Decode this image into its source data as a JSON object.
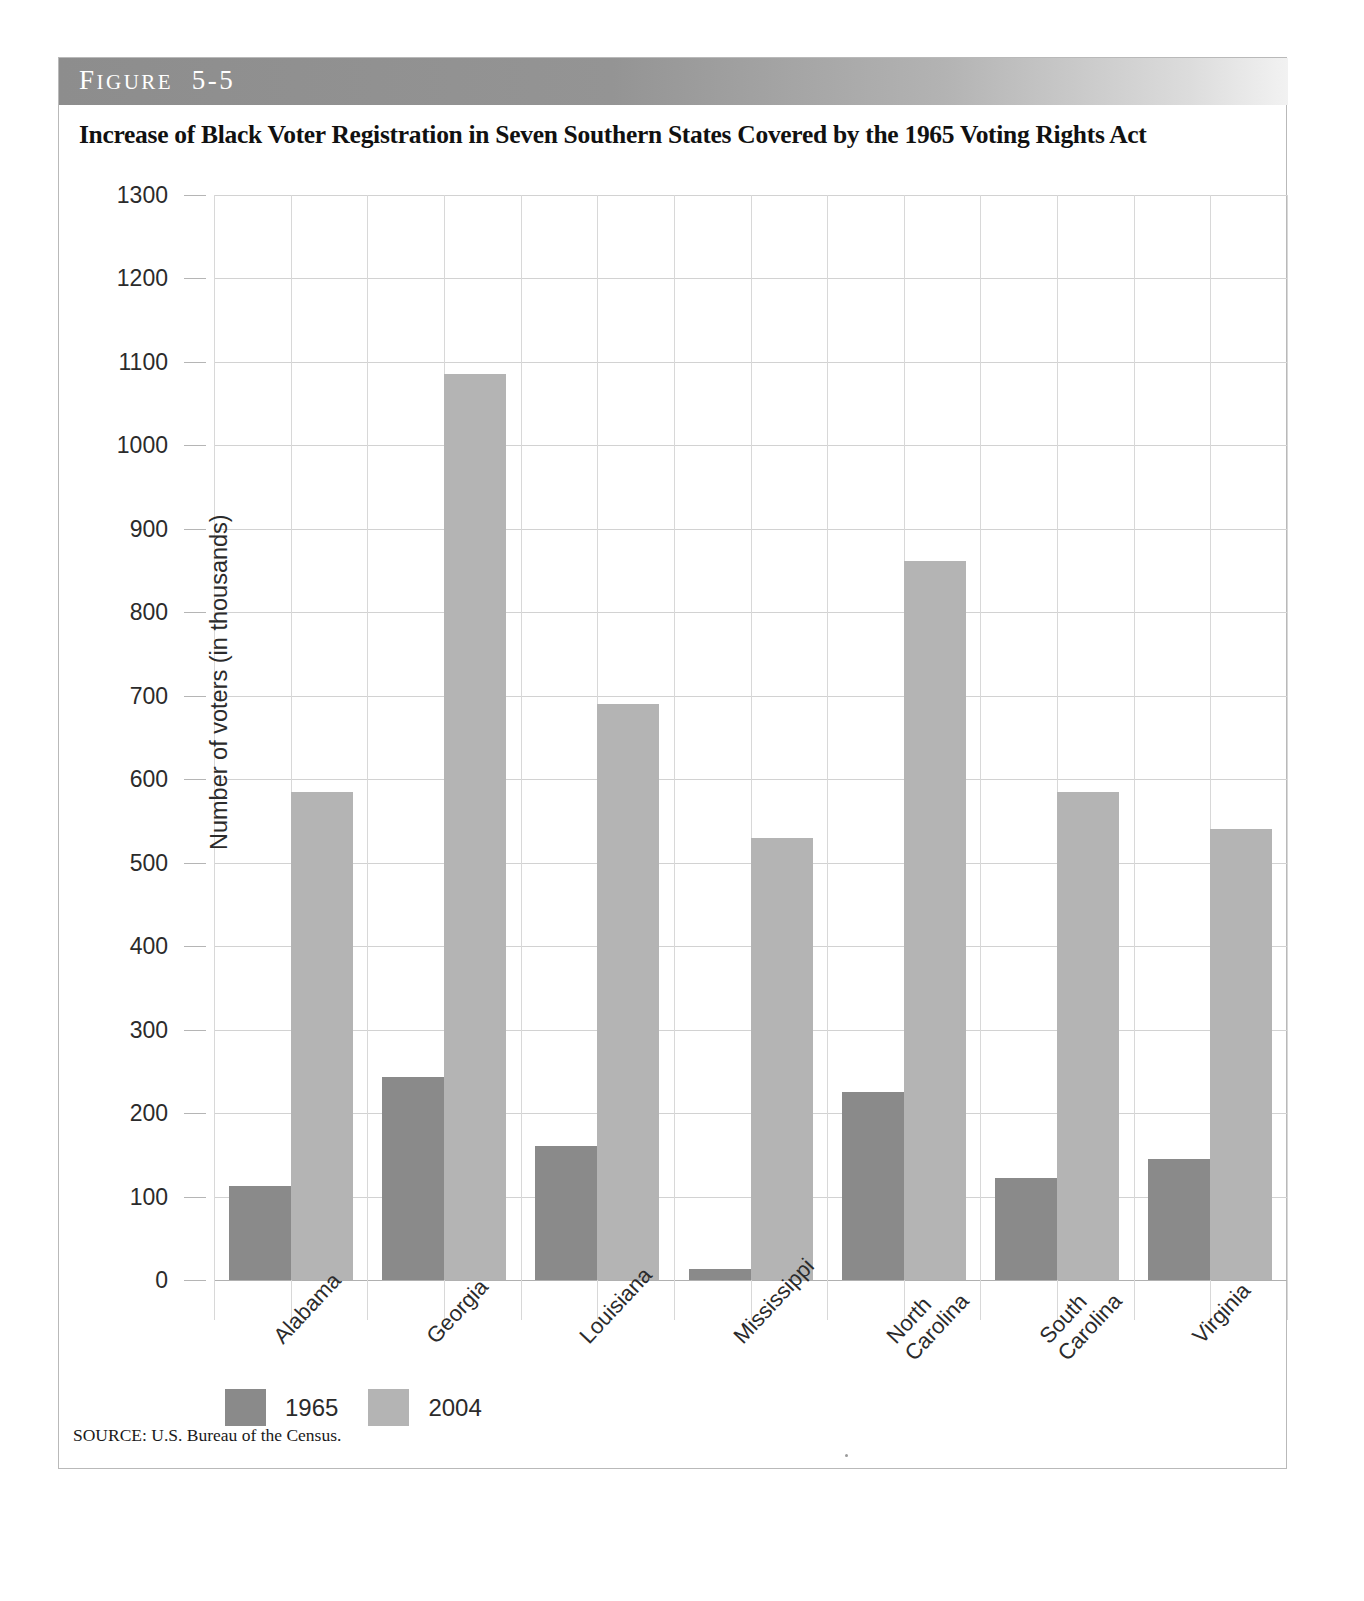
{
  "figure": {
    "banner_label_first": "F",
    "banner_label_rest": "IGURE",
    "banner_number": "5-5",
    "banner_full": "FIGURE 5-5",
    "title": "Increase of Black Voter Registration in Seven Southern States Covered by the 1965 Voting Rights Act",
    "source": "SOURCE: U.S. Bureau of the Census."
  },
  "chart_data": {
    "type": "bar",
    "title": "Increase of Black Voter Registration in Seven Southern States Covered by the 1965 Voting Rights Act",
    "xlabel": "",
    "ylabel": "Number of voters (in thousands)",
    "ylim": [
      0,
      1300
    ],
    "ytick_step": 100,
    "yticks": [
      "0",
      "100",
      "200",
      "300",
      "400",
      "500",
      "600",
      "700",
      "800",
      "900",
      "1000",
      "1100",
      "1200",
      "1300"
    ],
    "grid": true,
    "legend_position": "bottom-left",
    "categories": [
      "Alabama",
      "Georgia",
      "Louisiana",
      "Mississippi",
      "North Carolina",
      "South Carolina",
      "Virginia"
    ],
    "category_lines": [
      [
        "Alabama"
      ],
      [
        "Georgia"
      ],
      [
        "Louisiana"
      ],
      [
        "Mississippi"
      ],
      [
        "North",
        "Carolina"
      ],
      [
        "South",
        "Carolina"
      ],
      [
        "Virginia"
      ]
    ],
    "series": [
      {
        "name": "1965",
        "color": "#8a8a8a",
        "values": [
          113,
          243,
          160,
          13,
          225,
          122,
          145
        ]
      },
      {
        "name": "2004",
        "color": "#b4b4b4",
        "values": [
          585,
          1085,
          690,
          530,
          862,
          585,
          540
        ]
      }
    ]
  },
  "legend": {
    "items": [
      {
        "label": "1965",
        "color": "#8a8a8a"
      },
      {
        "label": "2004",
        "color": "#b4b4b4"
      }
    ]
  },
  "page": {
    "bottom_fragment": ""
  }
}
